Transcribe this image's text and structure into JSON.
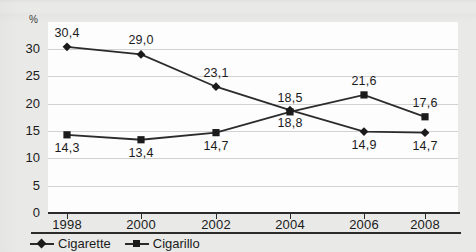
{
  "chart_data": {
    "type": "line",
    "title": "",
    "subtitle": "",
    "xlabel": "",
    "ylabel": "%",
    "unit_label": "%",
    "categories": [
      "1998",
      "2000",
      "2002",
      "2004",
      "2006",
      "2008"
    ],
    "x": [
      1998,
      2000,
      2002,
      2004,
      2006,
      2008
    ],
    "ylim": [
      0,
      32
    ],
    "yticks": [
      0,
      5,
      10,
      15,
      20,
      25,
      30
    ],
    "ytick_labels": [
      "0",
      "5",
      "10",
      "15",
      "20",
      "25",
      "30"
    ],
    "grid": true,
    "legend_position": "bottom-left",
    "decimal_separator": ",",
    "series": [
      {
        "name": "Cigarette",
        "marker": "diamond",
        "values": [
          30.4,
          29.0,
          23.1,
          18.8,
          14.9,
          14.7
        ],
        "labels": [
          "30,4",
          "29,0",
          "23,1",
          "18,8",
          "14,9",
          "14,7"
        ],
        "label_positions": [
          "above",
          "above",
          "above",
          "below",
          "below",
          "below"
        ]
      },
      {
        "name": "Cigarillo",
        "marker": "square",
        "values": [
          14.3,
          13.4,
          14.7,
          18.5,
          21.6,
          17.6
        ],
        "labels": [
          "14,3",
          "13,4",
          "14,7",
          "18,5",
          "21,6",
          "17,6"
        ],
        "label_positions": [
          "below",
          "below",
          "below",
          "above",
          "above",
          "above"
        ]
      }
    ],
    "colors": {
      "line": "#2b2b2b",
      "marker": "#1b1b1b",
      "grid": "#d2d2d0",
      "axis": "#2b2b2b",
      "plot_background": "#fdfdfd",
      "page_background": "#e9e9e7",
      "text": "#1b1b1b"
    }
  },
  "legend": {
    "items": [
      {
        "label": "Cigarette",
        "marker": "diamond"
      },
      {
        "label": "Cigarillo",
        "marker": "square"
      }
    ]
  }
}
